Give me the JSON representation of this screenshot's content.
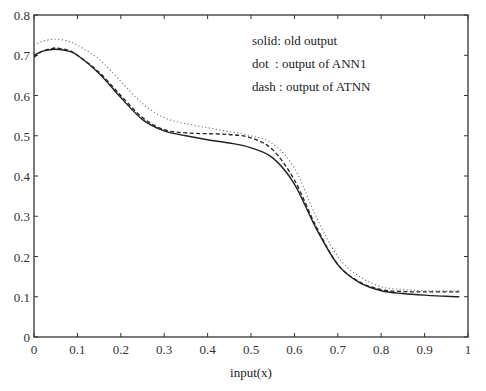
{
  "chart_data": {
    "type": "line",
    "title": "",
    "xlabel": "input(x)",
    "ylabel": "output(y)",
    "xlim": [
      0,
      1
    ],
    "ylim": [
      0,
      0.8
    ],
    "xticks": [
      0,
      0.1,
      0.2,
      0.3,
      0.4,
      0.5,
      0.6,
      0.7,
      0.8,
      0.9,
      1
    ],
    "xtick_labels": [
      "0",
      "0.1",
      "0.2",
      "0.3",
      "0.4",
      "0.5",
      "0.6",
      "0.7",
      "0.8",
      "0.9",
      "1"
    ],
    "yticks": [
      0,
      0.1,
      0.2,
      0.3,
      0.4,
      0.5,
      0.6,
      0.7,
      0.8
    ],
    "ytick_labels": [
      "0",
      "0.1",
      "0.2",
      "0.3",
      "0.4",
      "0.5",
      "0.6",
      "0.7",
      "0.8"
    ],
    "grid": false,
    "legend_position": "upper right (text annotation)",
    "legend": [
      "solid: old output",
      "dot  : output of ANN1",
      "dash : output of ATNN"
    ],
    "series": [
      {
        "name": "old output",
        "style": "solid",
        "x": [
          0,
          0.02,
          0.05,
          0.08,
          0.1,
          0.15,
          0.2,
          0.25,
          0.3,
          0.35,
          0.4,
          0.45,
          0.5,
          0.55,
          0.6,
          0.65,
          0.7,
          0.75,
          0.8,
          0.85,
          0.9,
          0.95,
          0.98
        ],
        "y": [
          0.7,
          0.71,
          0.715,
          0.71,
          0.7,
          0.655,
          0.595,
          0.54,
          0.512,
          0.5,
          0.49,
          0.482,
          0.47,
          0.445,
          0.38,
          0.27,
          0.18,
          0.135,
          0.115,
          0.108,
          0.104,
          0.101,
          0.1
        ]
      },
      {
        "name": "output of ANN1",
        "style": "dot",
        "x": [
          0,
          0.02,
          0.05,
          0.08,
          0.1,
          0.15,
          0.2,
          0.25,
          0.3,
          0.35,
          0.4,
          0.45,
          0.5,
          0.55,
          0.6,
          0.65,
          0.7,
          0.75,
          0.8,
          0.85,
          0.9,
          0.95,
          0.98
        ],
        "y": [
          0.725,
          0.735,
          0.74,
          0.735,
          0.725,
          0.69,
          0.635,
          0.58,
          0.545,
          0.53,
          0.52,
          0.51,
          0.5,
          0.48,
          0.42,
          0.3,
          0.2,
          0.15,
          0.125,
          0.118,
          0.115,
          0.115,
          0.115
        ]
      },
      {
        "name": "output of ATNN",
        "style": "dash",
        "x": [
          0,
          0.02,
          0.05,
          0.08,
          0.1,
          0.15,
          0.2,
          0.25,
          0.3,
          0.35,
          0.4,
          0.45,
          0.5,
          0.55,
          0.6,
          0.65,
          0.7,
          0.75,
          0.8,
          0.85,
          0.9,
          0.95,
          0.98
        ],
        "y": [
          0.695,
          0.71,
          0.718,
          0.712,
          0.7,
          0.658,
          0.6,
          0.545,
          0.515,
          0.507,
          0.505,
          0.503,
          0.495,
          0.465,
          0.39,
          0.275,
          0.18,
          0.137,
          0.118,
          0.113,
          0.112,
          0.112,
          0.112
        ]
      }
    ]
  }
}
